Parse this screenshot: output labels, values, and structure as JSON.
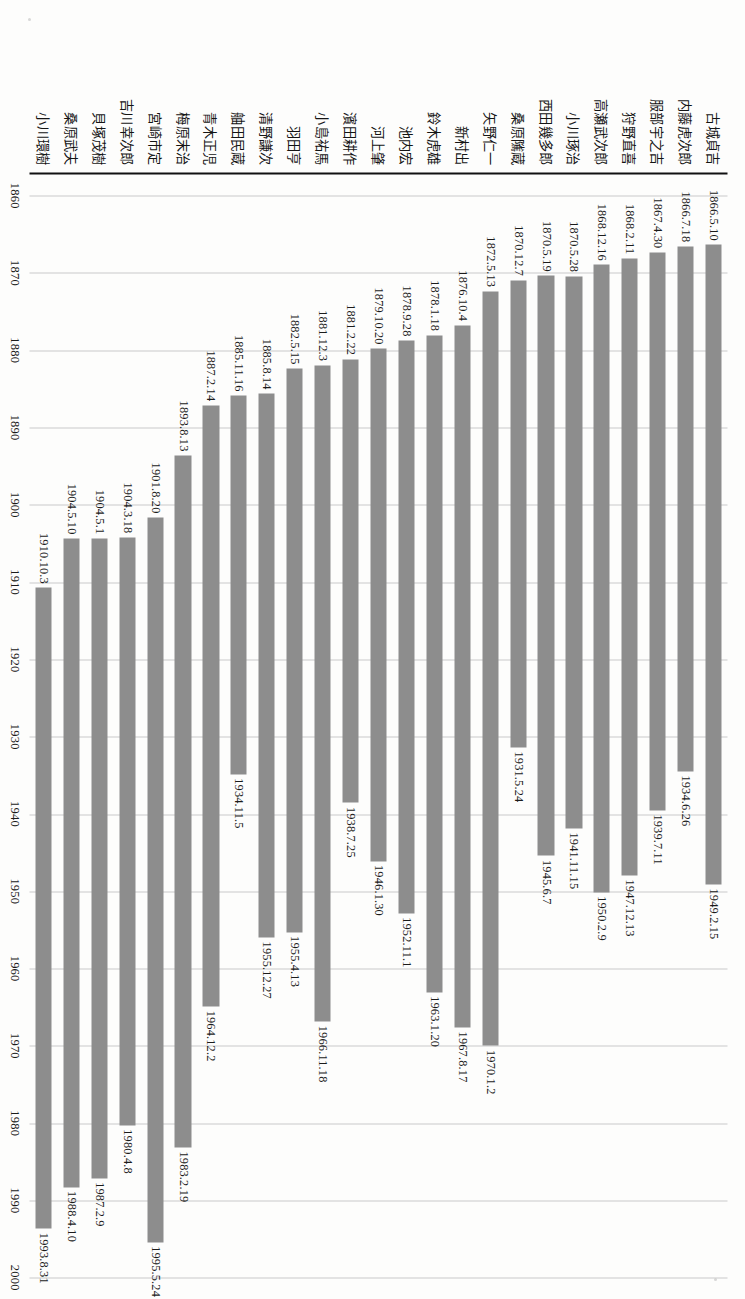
{
  "chart_data": {
    "type": "bar",
    "orientation": "horizontal-gantt",
    "title": "",
    "subtitle": "",
    "xlabel": "",
    "ylabel": "",
    "grid": true,
    "legend": null,
    "axis_ticks": [
      "1860",
      "1870",
      "1880",
      "1890",
      "1900",
      "1910",
      "1920",
      "1930",
      "1940",
      "1950",
      "1960",
      "1970",
      "1980",
      "1990",
      "2000"
    ],
    "axis_tick_values": [
      1860,
      1870,
      1880,
      1890,
      1900,
      1910,
      1920,
      1930,
      1940,
      1950,
      1960,
      1970,
      1980,
      1990,
      2000
    ],
    "xlim": [
      1857,
      2001
    ],
    "categories": [
      "古城貞吉",
      "内藤虎次郎",
      "服部宇之吉",
      "狩野直喜",
      "高瀬武次郎",
      "小川琢治",
      "西田幾多郎",
      "桑原隲蔵",
      "矢野仁一",
      "新村出",
      "鈴木虎雄",
      "池内宏",
      "河上肇",
      "濱田耕作",
      "小島祐馬",
      "羽田亨",
      "清野謙次",
      "舳田民蔵",
      "青木正児",
      "梅原末治",
      "宮崎市定",
      "吉川幸次郎",
      "貝塚茂樹",
      "桑原武夫",
      "小川環樹"
    ],
    "series": [
      {
        "name": "生没年",
        "bars": [
          {
            "category": "古城貞吉",
            "start_label": "1866.5.10",
            "end_label": "1949.2.15",
            "start": 1866.36,
            "end": 1949.12
          },
          {
            "category": "内藤虎次郎",
            "start_label": "1866.7.18",
            "end_label": "1934.6.26",
            "start": 1866.55,
            "end": 1934.49
          },
          {
            "category": "服部宇之吉",
            "start_label": "1867.4.30",
            "end_label": "1939.7.11",
            "start": 1867.33,
            "end": 1939.53
          },
          {
            "category": "狩野直喜",
            "start_label": "1868.2.11",
            "end_label": "1947.12.13",
            "start": 1868.11,
            "end": 1947.95
          },
          {
            "category": "高瀬武次郎",
            "start_label": "1868.12.16",
            "end_label": "1950.2.9",
            "start": 1868.96,
            "end": 1950.11
          },
          {
            "category": "小川琢治",
            "start_label": "1870.5.28",
            "end_label": "1941.11.15",
            "start": 1870.41,
            "end": 1941.87
          },
          {
            "category": "西田幾多郎",
            "start_label": "1870.5.19",
            "end_label": "1945.6.7",
            "start": 1870.38,
            "end": 1945.43
          },
          {
            "category": "桑原隲蔵",
            "start_label": "1870.12.7",
            "end_label": "1931.5.24",
            "start": 1870.93,
            "end": 1931.39
          },
          {
            "category": "矢野仁一",
            "start_label": "1872.5.13",
            "end_label": "1970.1.2",
            "start": 1872.36,
            "end": 1970.01
          },
          {
            "category": "新村出",
            "start_label": "1876.10.4",
            "end_label": "1967.8.17",
            "start": 1876.76,
            "end": 1967.63
          },
          {
            "category": "鈴木虎雄",
            "start_label": "1878.1.18",
            "end_label": "1963.1.20",
            "start": 1878.05,
            "end": 1963.05
          },
          {
            "category": "池内宏",
            "start_label": "1878.9.28",
            "end_label": "1952.11.1",
            "start": 1878.74,
            "end": 1952.83
          },
          {
            "category": "河上肇",
            "start_label": "1879.10.20",
            "end_label": "1946.1.30",
            "start": 1879.8,
            "end": 1946.08
          },
          {
            "category": "濱田耕作",
            "start_label": "1881.2.22",
            "end_label": "1938.7.25",
            "start": 1881.14,
            "end": 1938.56
          },
          {
            "category": "小島祐馬",
            "start_label": "1881.12.3",
            "end_label": "1966.11.18",
            "start": 1881.92,
            "end": 1966.88
          },
          {
            "category": "羽田亨",
            "start_label": "1882.5.15",
            "end_label": "1955.4.13",
            "start": 1882.37,
            "end": 1955.28
          },
          {
            "category": "清野謙次",
            "start_label": "1885.8.14",
            "end_label": "1955.12.27",
            "start": 1885.62,
            "end": 1955.99
          },
          {
            "category": "舳田民蔵",
            "start_label": "1885.11.16",
            "end_label": "1934.11.5",
            "start": 1885.88,
            "end": 1934.85
          },
          {
            "category": "青木正児",
            "start_label": "1887.2.14",
            "end_label": "1964.12.2",
            "start": 1887.12,
            "end": 1964.92
          },
          {
            "category": "梅原末治",
            "start_label": "1893.8.13",
            "end_label": "1983.2.19",
            "start": 1893.62,
            "end": 1983.14
          },
          {
            "category": "宮崎市定",
            "start_label": "1901.8.20",
            "end_label": "1995.5.24",
            "start": 1901.64,
            "end": 1995.39
          },
          {
            "category": "吉川幸次郎",
            "start_label": "1904.3.18",
            "end_label": "1980.4.8",
            "start": 1904.21,
            "end": 1980.27
          },
          {
            "category": "貝塚茂樹",
            "start_label": "1904.5.1",
            "end_label": "1987.2.9",
            "start": 1904.33,
            "end": 1987.11
          },
          {
            "category": "桑原武夫",
            "start_label": "1904.5.10",
            "end_label": "1988.4.10",
            "start": 1904.36,
            "end": 1988.27
          },
          {
            "category": "小川環樹",
            "start_label": "1910.10.3",
            "end_label": "1993.8.31",
            "start": 1910.75,
            "end": 1993.67
          }
        ]
      }
    ],
    "colors": {
      "bar": "#8d8d8d",
      "gridline": "#c9c9c9",
      "axis": "#111111",
      "text": "#1a1a1a"
    }
  }
}
